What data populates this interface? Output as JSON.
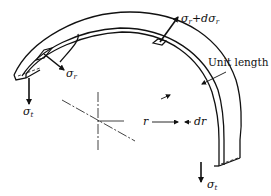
{
  "diagram": {
    "labels": {
      "sigma_r_left": {
        "main": "σ",
        "sub": "r"
      },
      "sigma_r_top": {
        "main": "σ",
        "sub": "r",
        "suffix": "+dσ",
        "suffix_sub": "r"
      },
      "sigma_t_left": {
        "main": "σ",
        "sub": "t"
      },
      "sigma_t_right": {
        "main": "σ",
        "sub": "t"
      },
      "unit_length": "Unit length",
      "radius": "r",
      "thickness": "dr"
    },
    "colors": {
      "stroke": "#111111",
      "background": "#ffffff"
    }
  }
}
